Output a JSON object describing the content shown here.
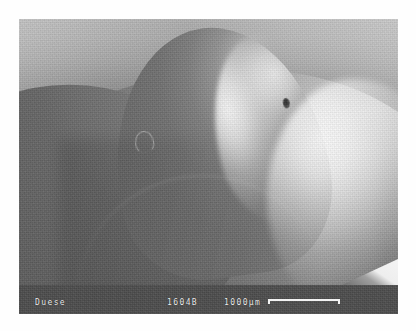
{
  "micrograph": {
    "technique": "scanning-electron-micrograph",
    "subject_description": "Dome-shaped nozzle specimen imaged at a low oblique angle; bright specular rim along the upper-right flank, broad dark skirt at lower left, banded stage backdrop.",
    "features": [
      {
        "name": "pore",
        "description": "small dark elliptical pore on the bright right flank"
      },
      {
        "name": "ring-mark",
        "description": "faint circular ring/arc mark on the dark left face"
      }
    ]
  },
  "info_bar": {
    "sample_label": "Duese",
    "specimen_id": "1604B",
    "scale_value": "1000µm",
    "scale_bar": {
      "length_px": 72,
      "unit": "µm",
      "length_value": 1000
    }
  },
  "colors": {
    "page_background": "#fefefe",
    "info_bar_background": "#4e4e4e",
    "info_bar_text": "#ededed",
    "scale_bar": "#f2f2f2",
    "backdrop_light": "#c9c9c9",
    "backdrop_dark": "#8a8a8a",
    "specimen_dark": "#5e5e5e",
    "specimen_highlight": "#ffffff"
  }
}
